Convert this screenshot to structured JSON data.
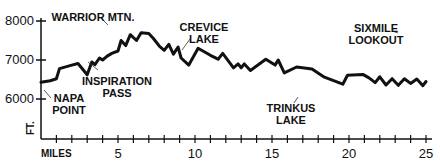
{
  "chart_data": {
    "type": "line",
    "title": "",
    "xlabel": "MILES",
    "ylabel": "FT.",
    "xlim": [
      0,
      25
    ],
    "ylim": [
      5500,
      8100
    ],
    "grid": false,
    "legend": null,
    "x_ticks": [
      5,
      10,
      15,
      20,
      25
    ],
    "x_minor_tick_step": 1,
    "y_ticks": [
      6000,
      7000,
      8000
    ],
    "y_tick_labels": [
      "6000",
      "7000",
      "8000"
    ],
    "series": [
      {
        "name": "Elevation profile",
        "color": "#111111",
        "points": [
          [
            0.0,
            6430
          ],
          [
            0.6,
            6470
          ],
          [
            1.0,
            6520
          ],
          [
            1.2,
            6780
          ],
          [
            2.0,
            6870
          ],
          [
            2.4,
            6910
          ],
          [
            3.0,
            6620
          ],
          [
            3.3,
            6950
          ],
          [
            3.5,
            6880
          ],
          [
            3.8,
            7050
          ],
          [
            4.0,
            7000
          ],
          [
            4.3,
            7100
          ],
          [
            4.6,
            7170
          ],
          [
            5.0,
            7230
          ],
          [
            5.2,
            7500
          ],
          [
            5.5,
            7370
          ],
          [
            5.8,
            7650
          ],
          [
            6.2,
            7500
          ],
          [
            6.5,
            7700
          ],
          [
            7.0,
            7680
          ],
          [
            7.3,
            7550
          ],
          [
            7.7,
            7350
          ],
          [
            8.0,
            7250
          ],
          [
            8.3,
            7400
          ],
          [
            8.6,
            7150
          ],
          [
            8.9,
            7330
          ],
          [
            9.1,
            7050
          ],
          [
            9.6,
            6870
          ],
          [
            10.2,
            7300
          ],
          [
            11.0,
            7120
          ],
          [
            11.5,
            7020
          ],
          [
            11.8,
            7170
          ],
          [
            12.5,
            6800
          ],
          [
            12.8,
            6900
          ],
          [
            13.0,
            6800
          ],
          [
            13.2,
            6900
          ],
          [
            13.6,
            6730
          ],
          [
            14.6,
            7020
          ],
          [
            15.2,
            6870
          ],
          [
            15.4,
            7000
          ],
          [
            15.8,
            6670
          ],
          [
            16.6,
            6820
          ],
          [
            17.6,
            6770
          ],
          [
            18.4,
            6560
          ],
          [
            19.6,
            6380
          ],
          [
            19.9,
            6610
          ],
          [
            20.9,
            6630
          ],
          [
            21.3,
            6540
          ],
          [
            21.7,
            6420
          ],
          [
            22.0,
            6570
          ],
          [
            22.4,
            6360
          ],
          [
            22.8,
            6520
          ],
          [
            23.2,
            6350
          ],
          [
            23.6,
            6520
          ],
          [
            24.0,
            6400
          ],
          [
            24.4,
            6510
          ],
          [
            24.8,
            6340
          ],
          [
            25.0,
            6450
          ]
        ]
      }
    ],
    "annotations": [
      {
        "text": [
          "NAPA",
          "POINT"
        ],
        "x": 0.0,
        "y": 6430
      },
      {
        "text": [
          "INSPIRATION",
          "PASS"
        ],
        "x": 3.8,
        "y": 7050
      },
      {
        "text": [
          "WARRIOR MTN."
        ],
        "x": 6.5,
        "y": 7700
      },
      {
        "text": [
          "CREVICE",
          "LAKE"
        ],
        "x": 10.3,
        "y": 7280
      },
      {
        "text": [
          "TRINKUS",
          "LAKE"
        ],
        "x": 16.4,
        "y": 6450
      },
      {
        "text": [
          "SIXMILE",
          "LOOKOUT"
        ],
        "x": 24.0,
        "y": 7620
      }
    ]
  },
  "labels": {
    "y_8000": "8000",
    "y_7000": "7000",
    "y_6000": "6000",
    "x_5": "5",
    "x_10": "10",
    "x_15": "15",
    "x_20": "20",
    "x_25": "25",
    "x_unit": "MILES",
    "y_unit": "FT.",
    "napa_1": "NAPA",
    "napa_2": "POINT",
    "inspiration_1": "INSPIRATION",
    "inspiration_2": "PASS",
    "warrior": "WARRIOR MTN.",
    "crevice_1": "CREVICE",
    "crevice_2": "LAKE",
    "trinkus_1": "TRINKUS",
    "trinkus_2": "LAKE",
    "sixmile_1": "SIXMILE",
    "sixmile_2": "LOOKOUT"
  }
}
